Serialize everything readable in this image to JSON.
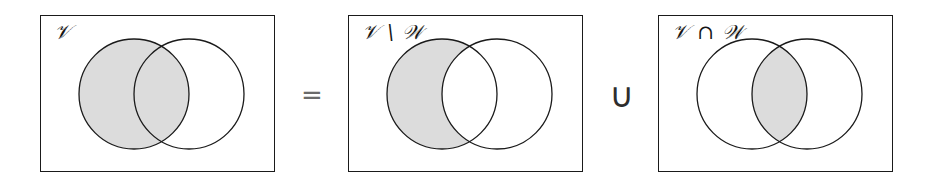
{
  "figure": {
    "name": "set-identity-venn-diagram",
    "equation": "V = (V \\ W) ∪ (V ∩ W)",
    "background_color": "#ffffff",
    "outline_color": "#1a1a1a",
    "shade_color": "#dcdcdc"
  },
  "panels": [
    {
      "id": "panel-1",
      "label": "𝒱",
      "label_plain": "V",
      "shaded_region": "left-circle-full",
      "shaded_description": "entire set V",
      "circles": [
        {
          "name": "V",
          "cx": 93,
          "cy": 78,
          "r": 55,
          "shaded": true
        },
        {
          "name": "W",
          "cx": 148,
          "cy": 78,
          "r": 55,
          "shaded": false
        }
      ]
    },
    {
      "id": "panel-2",
      "label": "𝒱 \\ 𝒲",
      "label_plain": "V \\ W",
      "shaded_region": "left-crescent",
      "shaded_description": "set difference V minus W",
      "circles": [
        {
          "name": "V",
          "cx": 93,
          "cy": 78,
          "r": 55,
          "shaded": true
        },
        {
          "name": "W",
          "cx": 148,
          "cy": 78,
          "r": 55,
          "shaded": false
        }
      ]
    },
    {
      "id": "panel-3",
      "label": "𝒱 ∩ 𝒲",
      "label_plain": "V ∩ W",
      "shaded_region": "lens-intersection",
      "shaded_description": "intersection of V and W",
      "circles": [
        {
          "name": "V",
          "cx": 93,
          "cy": 78,
          "r": 55,
          "shaded": false
        },
        {
          "name": "W",
          "cx": 148,
          "cy": 78,
          "r": 55,
          "shaded": false
        }
      ]
    }
  ],
  "operators": {
    "equals": "=",
    "union": "∪"
  }
}
